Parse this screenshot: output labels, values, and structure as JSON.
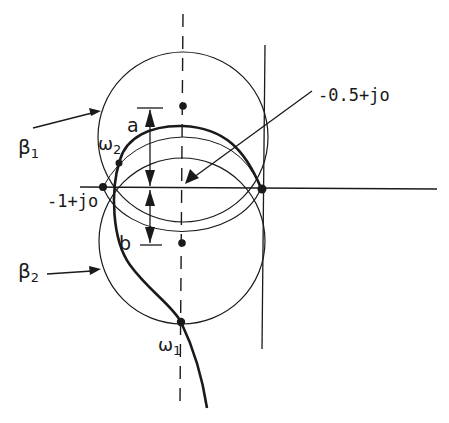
{
  "diagram": {
    "type": "nyquist-circle-construction",
    "labels": {
      "beta1": "β",
      "beta1_sub": "1",
      "beta2": "β",
      "beta2_sub": "2",
      "omega1": "ω",
      "omega1_sub": "1",
      "omega2": "ω",
      "omega2_sub": "2",
      "a": "a",
      "b": "b",
      "minus_one_point": "-1+jo",
      "minus_half_point": "-0.5+jo"
    },
    "colors": {
      "ink": "#1a1a1a",
      "background": "#ffffff"
    },
    "elements": [
      {
        "id": "real-axis",
        "kind": "line",
        "style": "solid"
      },
      {
        "id": "vertical-axis-dashed",
        "kind": "line",
        "style": "dashed",
        "note": "vertical line through -0.5"
      },
      {
        "id": "imaginary-axis",
        "kind": "line",
        "style": "solid"
      },
      {
        "id": "circle-beta1",
        "kind": "circle",
        "label": "β1"
      },
      {
        "id": "circle-beta2",
        "kind": "circle",
        "label": "β2"
      },
      {
        "id": "nyquist-locus",
        "kind": "curve",
        "style": "thick",
        "points": [
          "ω2",
          "ω1"
        ]
      },
      {
        "id": "dimension-a",
        "kind": "dimension",
        "label": "a"
      },
      {
        "id": "dimension-b",
        "kind": "dimension",
        "label": "b"
      }
    ]
  }
}
